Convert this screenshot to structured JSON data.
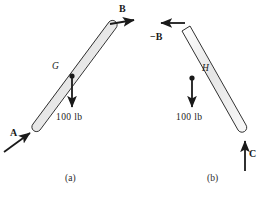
{
  "figure": {
    "background_color": "#ffffff",
    "ink_color": "#1a1a1a",
    "rod_fill_color": "#e8e8e8",
    "rod_outline_color": "#1a1a1a"
  },
  "panels": [
    {
      "caption": "(a)",
      "caption_x": 65,
      "caption_y": 175,
      "rod": {
        "name": "rod-ab",
        "shape": "straight-capsule",
        "x1": 36,
        "y1": 127,
        "x2": 112,
        "y2": 25,
        "thickness": 9
      },
      "points": [
        {
          "label": "G",
          "name": "point-g",
          "x": 52,
          "y": 62,
          "dot_x": 71,
          "dot_y": 76
        }
      ],
      "forces": [
        {
          "name": "force-a",
          "label": "A",
          "label_style": "italic",
          "label_x": 10,
          "label_y": 130,
          "from_x": 4,
          "from_y": 152,
          "to_x": 32,
          "to_y": 132
        },
        {
          "name": "force-b",
          "label": "B",
          "label_style": "bold",
          "label_x": 120,
          "label_y": 5,
          "from_x": 110,
          "from_y": 24,
          "to_x": 137,
          "to_y": 20
        },
        {
          "name": "weight-100lb",
          "label": "100 lb",
          "label_style": "plain",
          "label_x": 57,
          "label_y": 114,
          "from_x": 72,
          "from_y": 76,
          "to_x": 72,
          "to_y": 110
        }
      ]
    },
    {
      "caption": "(b)",
      "caption_x": 207,
      "caption_y": 175,
      "rod": {
        "name": "rod-bc",
        "shape": "straight-capsule",
        "x1": 186,
        "y1": 28,
        "x2": 243,
        "y2": 129,
        "thickness": 9
      },
      "points": [
        {
          "label": "H",
          "name": "point-h",
          "x": 202,
          "y": 65,
          "dot_x": 192,
          "dot_y": 78
        }
      ],
      "forces": [
        {
          "name": "force-minus-b",
          "label": "−B",
          "label_style": "bold",
          "label_x": 152,
          "label_y": 33,
          "from_x": 185,
          "from_y": 23,
          "to_x": 158,
          "to_y": 23
        },
        {
          "name": "weight-100lb",
          "label": "100 lb",
          "label_style": "plain",
          "label_x": 177,
          "label_y": 114,
          "from_x": 192,
          "from_y": 78,
          "to_x": 192,
          "to_y": 110
        },
        {
          "name": "force-c",
          "label": "C",
          "label_style": "bold",
          "label_x": 249,
          "label_y": 150,
          "from_x": 245,
          "from_y": 171,
          "to_x": 245,
          "to_y": 138
        }
      ]
    }
  ]
}
